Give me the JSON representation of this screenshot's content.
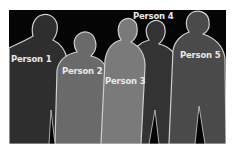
{
  "figure": {
    "background_color": "#050505",
    "outline_color": "#cfcfcf",
    "persons": [
      {
        "label": "Person 1",
        "fill": "#2e2e2e"
      },
      {
        "label": "Person 2",
        "fill": "#6a6a6a"
      },
      {
        "label": "Person 3",
        "fill": "#7a7a7a"
      },
      {
        "label": "Person 4",
        "fill": "#333333"
      },
      {
        "label": "Person 5",
        "fill": "#4a4a4a"
      }
    ]
  }
}
